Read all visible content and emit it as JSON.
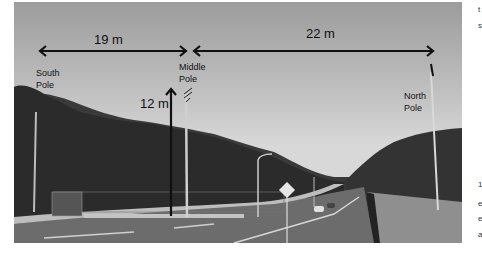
{
  "figure": {
    "labels": {
      "south_pole": [
        "South",
        "Pole"
      ],
      "middle_pole": [
        "Middle",
        "Pole"
      ],
      "north_pole": [
        "North",
        "Pole"
      ]
    },
    "dimensions": {
      "south_to_middle": "19 m",
      "middle_to_north": "22 m",
      "middle_height": "12 m"
    },
    "colors": {
      "annotation": "#111111",
      "sky": "#c8c8c8",
      "foliage": "#2e2e2e",
      "road": "#6e6e6e"
    }
  },
  "side_text_fragments": [
    "t",
    "s",
    "1",
    "e",
    "e",
    "a"
  ]
}
